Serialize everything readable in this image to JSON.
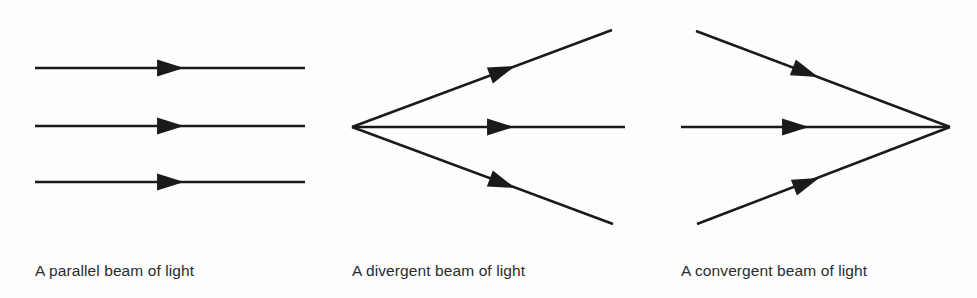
{
  "figure": {
    "background_color": "#fefefe",
    "stroke_color": "#1a1a1a",
    "text_color": "#2b2b2b",
    "width": 977,
    "height": 298
  },
  "panels": [
    {
      "id": "parallel",
      "caption": "A parallel beam of light",
      "beam_type": "parallel",
      "ray_count": 3
    },
    {
      "id": "divergent",
      "caption": "A divergent beam of light",
      "beam_type": "divergent",
      "ray_count": 3
    },
    {
      "id": "convergent",
      "caption": "A convergent beam of light",
      "beam_type": "convergent",
      "ray_count": 3
    }
  ],
  "chart_data": {
    "type": "diagram",
    "subtitle": "",
    "xlabel": "",
    "ylabel": "",
    "grid": false,
    "legend": null,
    "stroke_color": "#1a1a1a",
    "stroke_width": 2.6,
    "background_color": "#fefefe",
    "panels": [
      {
        "name": "parallel",
        "caption": "A parallel beam of light",
        "caption_position": [
          35,
          270
        ],
        "rays": [
          {
            "x1": 35,
            "y1": 68,
            "x2": 305,
            "y2": 68,
            "arrow_at": [
              170,
              68
            ],
            "angle_deg": 0
          },
          {
            "x1": 35,
            "y1": 126,
            "x2": 305,
            "y2": 126,
            "arrow_at": [
              170,
              126
            ],
            "angle_deg": 0
          },
          {
            "x1": 35,
            "y1": 182,
            "x2": 305,
            "y2": 182,
            "arrow_at": [
              170,
              182
            ],
            "angle_deg": 0
          }
        ]
      },
      {
        "name": "divergent",
        "caption": "A divergent beam of light",
        "caption_position": [
          352,
          270
        ],
        "apex": [
          352,
          127
        ],
        "rays": [
          {
            "x1": 352,
            "y1": 127,
            "x2": 612,
            "y2": 30,
            "arrow_at": [
              502,
              71
            ],
            "angle_deg": -20.5
          },
          {
            "x1": 352,
            "y1": 127,
            "x2": 625,
            "y2": 127,
            "arrow_at": [
              500,
              127
            ],
            "angle_deg": 0
          },
          {
            "x1": 352,
            "y1": 127,
            "x2": 613,
            "y2": 224,
            "arrow_at": [
              502,
              183
            ],
            "angle_deg": 20.4
          }
        ]
      },
      {
        "name": "convergent",
        "caption": "A convergent beam of light",
        "caption_position": [
          681,
          270
        ],
        "apex": [
          950,
          127
        ],
        "rays": [
          {
            "x1": 696,
            "y1": 31,
            "x2": 950,
            "y2": 127,
            "arrow_at": [
              805,
              72
            ],
            "angle_deg": 20.7
          },
          {
            "x1": 681,
            "y1": 127,
            "x2": 950,
            "y2": 127,
            "arrow_at": [
              795,
              127
            ],
            "angle_deg": 0
          },
          {
            "x1": 697,
            "y1": 224,
            "x2": 950,
            "y2": 127,
            "arrow_at": [
              806,
              183
            ],
            "angle_deg": -21.0
          }
        ]
      }
    ]
  }
}
